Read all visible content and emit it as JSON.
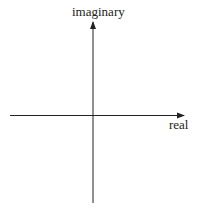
{
  "diagram": {
    "axes": {
      "vertical_label": "imaginary",
      "horizontal_label": "real"
    },
    "colors": {
      "axis": "#222222",
      "background": "#ffffff"
    }
  }
}
